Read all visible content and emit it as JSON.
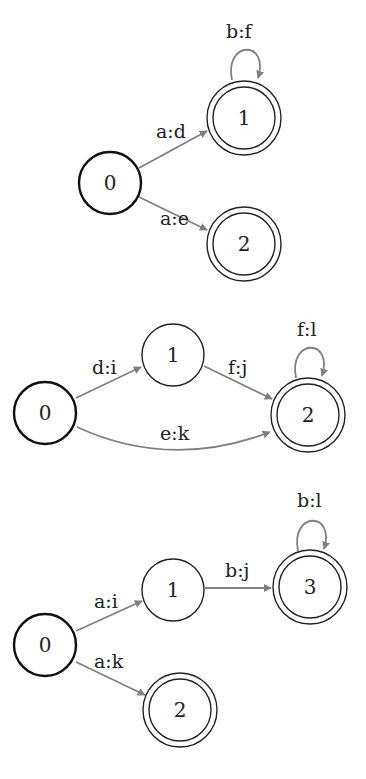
{
  "diagrams": [
    {
      "id": "fst-1",
      "states": [
        {
          "label": "0",
          "start": true,
          "final": false
        },
        {
          "label": "1",
          "start": false,
          "final": true
        },
        {
          "label": "2",
          "start": false,
          "final": true
        }
      ],
      "transitions": [
        {
          "from": "0",
          "to": "1",
          "label": "a:d"
        },
        {
          "from": "0",
          "to": "2",
          "label": "a:e"
        },
        {
          "from": "1",
          "to": "1",
          "label": "b:f"
        }
      ]
    },
    {
      "id": "fst-2",
      "states": [
        {
          "label": "0",
          "start": true,
          "final": false
        },
        {
          "label": "1",
          "start": false,
          "final": false
        },
        {
          "label": "2",
          "start": false,
          "final": true
        }
      ],
      "transitions": [
        {
          "from": "0",
          "to": "1",
          "label": "d:i"
        },
        {
          "from": "1",
          "to": "2",
          "label": "f:j"
        },
        {
          "from": "0",
          "to": "2",
          "label": "e:k"
        },
        {
          "from": "2",
          "to": "2",
          "label": "f:l"
        }
      ]
    },
    {
      "id": "fst-3",
      "states": [
        {
          "label": "0",
          "start": true,
          "final": false
        },
        {
          "label": "1",
          "start": false,
          "final": false
        },
        {
          "label": "3",
          "start": false,
          "final": true
        },
        {
          "label": "2",
          "start": false,
          "final": true
        }
      ],
      "transitions": [
        {
          "from": "0",
          "to": "1",
          "label": "a:i"
        },
        {
          "from": "1",
          "to": "3",
          "label": "b:j"
        },
        {
          "from": "3",
          "to": "3",
          "label": "b:l"
        },
        {
          "from": "0",
          "to": "2",
          "label": "a:k"
        }
      ]
    }
  ],
  "colors": {
    "edge": "#808080",
    "node_stroke": "#222222",
    "background": "#ffffff"
  }
}
